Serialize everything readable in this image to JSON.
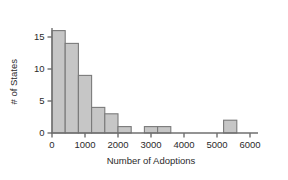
{
  "chart_data": {
    "type": "bar",
    "title": "",
    "subtitle": "",
    "xlabel": "Number of Adoptions",
    "ylabel": "# of States",
    "xlim": [
      0,
      6000
    ],
    "ylim": [
      0,
      16
    ],
    "grid": false,
    "legend": null,
    "bin_width": 400,
    "xticks": [
      0,
      1000,
      2000,
      3000,
      4000,
      5000,
      6000
    ],
    "xtick_labels": [
      "0",
      "1000",
      "2000",
      "3000",
      "4000",
      "5000",
      "6000"
    ],
    "yticks": [
      0,
      5,
      10,
      15
    ],
    "ytick_labels": [
      "0",
      "5",
      "10",
      "15"
    ],
    "bins": [
      {
        "start": 0,
        "end": 400,
        "value": 16
      },
      {
        "start": 400,
        "end": 800,
        "value": 14
      },
      {
        "start": 800,
        "end": 1200,
        "value": 9
      },
      {
        "start": 1200,
        "end": 1600,
        "value": 4
      },
      {
        "start": 1600,
        "end": 2000,
        "value": 3
      },
      {
        "start": 2000,
        "end": 2400,
        "value": 1
      },
      {
        "start": 2800,
        "end": 3200,
        "value": 1
      },
      {
        "start": 3200,
        "end": 3600,
        "value": 1
      },
      {
        "start": 5200,
        "end": 5600,
        "value": 2
      }
    ],
    "categories": [
      "0-400",
      "400-800",
      "800-1200",
      "1200-1600",
      "1600-2000",
      "2000-2400",
      "2800-3200",
      "3200-3600",
      "5200-5600"
    ],
    "values": [
      16,
      14,
      9,
      4,
      3,
      1,
      1,
      1,
      2
    ],
    "colors": {
      "bar_fill": "#c6c6c6",
      "bar_stroke": "#7a7a7a",
      "axis": "#6f6f6f",
      "text": "#2b2b2b",
      "background": "#ffffff"
    }
  }
}
